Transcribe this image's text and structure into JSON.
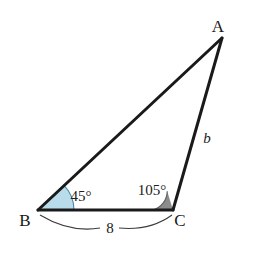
{
  "figure": {
    "type": "triangle-diagram",
    "background_color": "#ffffff",
    "stroke_color": "#1a1a1a",
    "vertices": {
      "a_label": "A",
      "b_label": "B",
      "c_label": "C"
    },
    "angles": {
      "at_b": {
        "label": "45°",
        "value": 45,
        "unit": "degrees",
        "arc_fill": "#b8dcea",
        "arc_stroke": "#5a8fa8"
      },
      "at_c": {
        "label": "105°",
        "value": 105,
        "unit": "degrees",
        "arc_fill": "#8c8c8c",
        "arc_stroke": "#6a6a6a"
      }
    },
    "sides": {
      "bc": {
        "label": "8",
        "value": 8,
        "annotation": "measure-arc-below"
      },
      "ca": {
        "label": "b",
        "value": null,
        "annotation": "unknown-side"
      }
    }
  }
}
